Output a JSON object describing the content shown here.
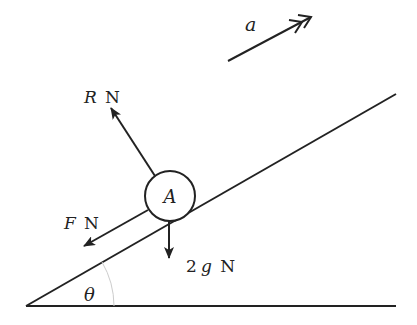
{
  "diagram": {
    "type": "free-body diagram on inclined plane",
    "colors": {
      "stroke": "#222222",
      "arc": "#cccccc",
      "background": "#ffffff"
    },
    "particle": {
      "label": "A"
    },
    "acceleration": {
      "symbol": "a"
    },
    "forces": {
      "reaction": {
        "symbol": "R",
        "unit": "N"
      },
      "friction": {
        "symbol": "F",
        "unit": "N"
      },
      "weight": {
        "coefficient": "2",
        "symbol": "g",
        "unit": "N"
      }
    },
    "angle": {
      "symbol": "θ"
    }
  }
}
